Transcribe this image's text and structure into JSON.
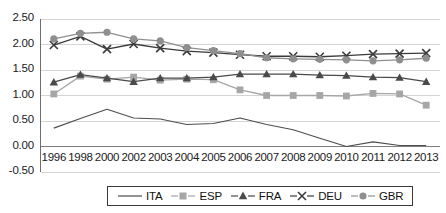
{
  "chart_data": {
    "type": "line",
    "title": "",
    "xlabel": "",
    "ylabel": "",
    "categories": [
      "1996",
      "1998",
      "2000",
      "2002",
      "2003",
      "2004",
      "2005",
      "2006",
      "2007",
      "2008",
      "2009",
      "2010",
      "2011",
      "2012",
      "2013"
    ],
    "ylim": [
      -0.5,
      2.5
    ],
    "ytick_labels": [
      "2.50",
      "2.00",
      "1.50",
      "1.00",
      "0.50",
      "0.00",
      "-0.50"
    ],
    "ytick_values": [
      2.5,
      2.0,
      1.5,
      1.0,
      0.5,
      0.0,
      -0.5
    ],
    "grid": true,
    "legend_position": "bottom",
    "series": [
      {
        "name": "ITA",
        "marker": "none",
        "color": "#4d4d4d",
        "values": [
          0.36,
          0.55,
          0.73,
          0.56,
          0.54,
          0.43,
          0.45,
          0.56,
          0.43,
          0.33,
          0.16,
          0.0,
          0.09,
          0.02,
          0.02
        ]
      },
      {
        "name": "ESP",
        "marker": "square",
        "color": "#a6a6a6",
        "values": [
          1.03,
          1.38,
          1.32,
          1.36,
          1.3,
          1.32,
          1.31,
          1.11,
          1.0,
          1.0,
          1.0,
          0.99,
          1.04,
          1.03,
          0.81
        ]
      },
      {
        "name": "FRA",
        "marker": "triangle",
        "color": "#4a4a4a",
        "values": [
          1.26,
          1.41,
          1.34,
          1.27,
          1.34,
          1.34,
          1.36,
          1.42,
          1.42,
          1.42,
          1.4,
          1.39,
          1.36,
          1.35,
          1.27
        ]
      },
      {
        "name": "DEU",
        "marker": "cross",
        "color": "#3a3a3a",
        "values": [
          1.99,
          2.16,
          1.91,
          2.01,
          1.93,
          1.87,
          1.84,
          1.8,
          1.77,
          1.77,
          1.76,
          1.78,
          1.81,
          1.82,
          1.83
        ]
      },
      {
        "name": "GBR",
        "marker": "circle",
        "color": "#8f8f8f",
        "values": [
          2.11,
          2.22,
          2.24,
          2.11,
          2.07,
          1.94,
          1.88,
          1.82,
          1.74,
          1.72,
          1.71,
          1.7,
          1.68,
          1.7,
          1.73
        ]
      }
    ]
  },
  "axis": {
    "ytick_0": "2.50",
    "ytick_1": "2.00",
    "ytick_2": "1.50",
    "ytick_3": "1.00",
    "ytick_4": "0.50",
    "ytick_5": "0.00",
    "ytick_6": "-0.50"
  },
  "legend": {
    "items": [
      {
        "label": "ITA"
      },
      {
        "label": "ESP"
      },
      {
        "label": "FRA"
      },
      {
        "label": "DEU"
      },
      {
        "label": "GBR"
      }
    ]
  }
}
